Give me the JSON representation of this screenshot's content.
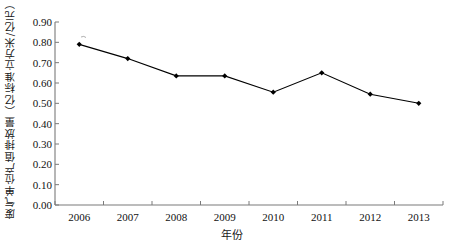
{
  "chart_data": {
    "type": "line",
    "title": "",
    "xlabel": "年份",
    "ylabel": "废气单位产值排放量（亿标准立方米/亿元）",
    "categories": [
      "2006",
      "2007",
      "2008",
      "2009",
      "2010",
      "2011",
      "2012",
      "2013"
    ],
    "values": [
      0.79,
      0.72,
      0.635,
      0.635,
      0.555,
      0.65,
      0.545,
      0.5
    ],
    "series": [
      {
        "name": "废气单位产值排放量",
        "values": [
          0.79,
          0.72,
          0.635,
          0.635,
          0.555,
          0.65,
          0.545,
          0.5
        ]
      }
    ],
    "ylim": [
      0.0,
      0.9
    ],
    "ytick_labels": [
      "0.00",
      "0.10",
      "0.20",
      "0.30",
      "0.40",
      "0.50",
      "0.60",
      "0.70",
      "0.80",
      "0.90"
    ],
    "ytick_values": [
      0.0,
      0.1,
      0.2,
      0.3,
      0.4,
      0.5,
      0.6,
      0.7,
      0.8,
      0.9
    ],
    "grid": false,
    "legend": "none",
    "line_color": "#000000",
    "marker": "diamond",
    "marker_color": "#000000",
    "axis_color": "#7a7a7a"
  }
}
